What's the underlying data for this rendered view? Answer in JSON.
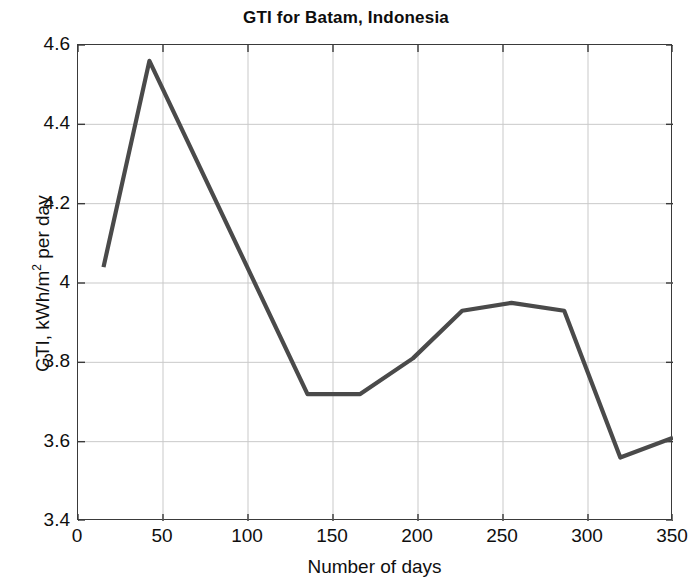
{
  "chart_data": {
    "type": "line",
    "title": "GTI for Batam, Indonesia",
    "xlabel": "Number of days",
    "ylabel": "GTI, kWh/m2 per day",
    "ylabel_parts": {
      "prefix": "GTI, kWh/m",
      "superscript": "2",
      "suffix": " per day"
    },
    "xlim": [
      0,
      350
    ],
    "ylim": [
      3.4,
      4.6
    ],
    "xticks": [
      0,
      50,
      100,
      150,
      200,
      250,
      300,
      350
    ],
    "xtick_labels": [
      "0",
      "50",
      "100",
      "150",
      "200",
      "250",
      "300",
      "350"
    ],
    "yticks": [
      3.4,
      3.6,
      3.8,
      4.0,
      4.2,
      4.4,
      4.6
    ],
    "ytick_labels": [
      "3.4",
      "3.6",
      "3.8",
      "4",
      "4.2",
      "4.4",
      "4.6"
    ],
    "grid": true,
    "legend": null,
    "line_color": "#4a4a4a",
    "line_width": 4.2,
    "series": [
      {
        "name": "GTI",
        "x": [
          15,
          42,
          135,
          166,
          197,
          226,
          255,
          286,
          319,
          350
        ],
        "y": [
          4.04,
          4.56,
          3.72,
          3.72,
          3.81,
          3.93,
          3.95,
          3.93,
          3.56,
          3.61
        ]
      }
    ]
  }
}
